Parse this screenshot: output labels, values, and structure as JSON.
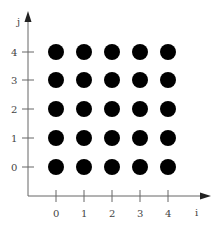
{
  "diagram": {
    "type": "lattice-grid",
    "x_axis": {
      "label": "i",
      "ticks": [
        "0",
        "1",
        "2",
        "3",
        "4"
      ]
    },
    "y_axis": {
      "label": "j",
      "ticks": [
        "0",
        "1",
        "2",
        "3",
        "4"
      ]
    },
    "points": {
      "rows": 5,
      "cols": 5,
      "color": "#000000"
    }
  }
}
